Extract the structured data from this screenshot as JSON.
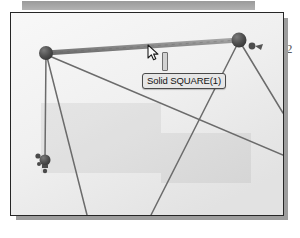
{
  "document": {
    "page_number": "2"
  },
  "toolbar": {
    "name": "toolbar-strip"
  },
  "viewport": {
    "name": "cad-viewport",
    "background_color": "#efefef",
    "border_color": "#262626"
  },
  "tooltip": {
    "text": "Solid SQUARE(1)",
    "background_color": "#e6e6e6",
    "border_color": "#4a4a4a"
  },
  "cursor": {
    "icon": "arrow-pointer-icon",
    "x": 147,
    "y": 44
  },
  "caret": {
    "icon": "text-caret-icon"
  },
  "model": {
    "selected_member_color": "#8a8a8a",
    "member_color": "#6b6b6b",
    "node_color": "#4a4a4a",
    "nodes": [
      {
        "id": "node-top-left",
        "x": 45,
        "y": 50,
        "r": 7,
        "label": "top-left-joint"
      },
      {
        "id": "node-top-right",
        "x": 238,
        "y": 38,
        "r": 7.5,
        "label": "top-right-joint"
      },
      {
        "id": "node-support-left",
        "x": 44,
        "y": 157,
        "r": 5.5,
        "label": "left-support-node"
      }
    ],
    "members": [
      {
        "id": "member-top-beam",
        "x1": 45,
        "y1": 50,
        "x2": 238,
        "y2": 38,
        "selected": true
      },
      {
        "id": "member-left-vert",
        "x1": 45,
        "y1": 50,
        "x2": 44,
        "y2": 157,
        "selected": false
      },
      {
        "id": "member-left-diag",
        "x1": 45,
        "y1": 50,
        "x2": 86,
        "y2": 213,
        "selected": false
      },
      {
        "id": "member-long-diag",
        "x1": 46,
        "y1": 52,
        "x2": 282,
        "y2": 153,
        "selected": false
      },
      {
        "id": "member-right-diag",
        "x1": 238,
        "y1": 38,
        "x2": 150,
        "y2": 213,
        "selected": false
      },
      {
        "id": "member-right-down",
        "x1": 239,
        "y1": 39,
        "x2": 282,
        "y2": 110,
        "selected": false
      }
    ],
    "markers": [
      {
        "id": "marker-right-arrow",
        "label": "load-arrow-icon",
        "x": 251,
        "y": 44
      },
      {
        "id": "marker-left-restraint",
        "label": "support-restraint-icon",
        "x": 36,
        "y": 153
      }
    ]
  }
}
